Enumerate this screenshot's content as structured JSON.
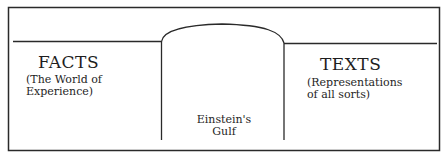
{
  "diagram": {
    "left_region": {
      "title": "FACTS",
      "subtitle_line1": "(The World of",
      "subtitle_line2": "Experience)"
    },
    "right_region": {
      "title": "TEXTS",
      "subtitle_line1": "(Representations",
      "subtitle_line2": "of all sorts)"
    },
    "gulf": {
      "label_line1": "Einstein's",
      "label_line2": "Gulf"
    },
    "colors": {
      "stroke": "#2a2a2a",
      "text": "#1e1e1e",
      "background": "#ffffff"
    }
  }
}
